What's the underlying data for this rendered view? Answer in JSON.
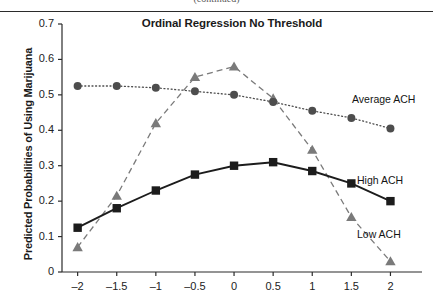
{
  "figure": {
    "top_cut_text": "(continued)",
    "title": "Ordinal Regression No Threshold",
    "ylabel": "Predicted Probabilities of Using Marijuana",
    "xlabel": ""
  },
  "annotations": [
    {
      "name": "average-ach",
      "text": "Average ACH"
    },
    {
      "name": "high-ach",
      "text": "High ACH"
    },
    {
      "name": "low-ach",
      "text": "Low ACH"
    }
  ],
  "chart_data": {
    "type": "line",
    "title": "Ordinal Regression No Threshold",
    "xlabel": "",
    "ylabel": "Predicted Probabilities of Using Marijuana",
    "x": [
      -2,
      -1.5,
      -1,
      -0.5,
      0,
      0.5,
      1,
      1.5,
      2
    ],
    "xtick_labels": [
      "–2",
      "–1.5",
      "–1",
      "–0.5",
      "0",
      "0.5",
      "1",
      "1.5",
      "2"
    ],
    "ytick_labels": [
      "0",
      "0.1",
      "0.2",
      "0.3",
      "0.4",
      "0.5",
      "0.6",
      "0.7"
    ],
    "yticks": [
      0,
      0.1,
      0.2,
      0.3,
      0.4,
      0.5,
      0.6,
      0.7
    ],
    "xlim": [
      -2.2,
      2.25
    ],
    "ylim": [
      0,
      0.7
    ],
    "grid": false,
    "legend": "inline-annotations",
    "series": [
      {
        "name": "Average ACH",
        "marker": "circle",
        "line_style": "dotted",
        "color": "#4d4d4d",
        "values": [
          0.525,
          0.525,
          0.52,
          0.51,
          0.5,
          0.48,
          0.455,
          0.435,
          0.405
        ]
      },
      {
        "name": "High ACH",
        "marker": "square",
        "line_style": "solid",
        "color": "#1c1c1c",
        "values": [
          0.125,
          0.18,
          0.23,
          0.275,
          0.3,
          0.31,
          0.285,
          0.25,
          0.2
        ]
      },
      {
        "name": "Low ACH",
        "marker": "triangle",
        "line_style": "dashed",
        "color": "#7a7a7a",
        "values": [
          0.07,
          0.215,
          0.42,
          0.55,
          0.58,
          0.49,
          0.345,
          0.155,
          0.03
        ]
      }
    ]
  }
}
